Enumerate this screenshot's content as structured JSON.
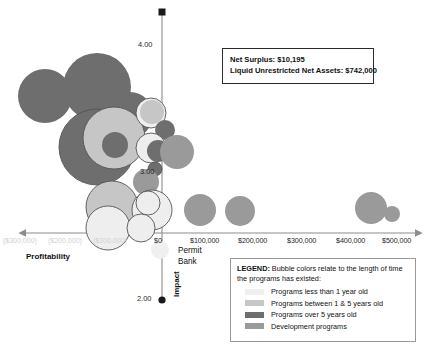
{
  "callout": {
    "line1": "Net Surplus: $10,195",
    "line2": "Liquid Unrestricted Net Assets: $742,000"
  },
  "annotations": {
    "permit_bank_line1": "Permit",
    "permit_bank_line2": "Bank"
  },
  "axes": {
    "x_title": "Profitability",
    "y_title": "Impact",
    "x_ticks": [
      "($300,000)",
      "($200,000)",
      "($100,000)",
      "$0",
      "$100,000",
      "$200,000",
      "$300,000",
      "$400,000",
      "$500,000"
    ],
    "y_ticks": [
      "4.00",
      "3.00",
      "2.00"
    ]
  },
  "legend": {
    "title": "LEGEND:",
    "description": " Bubble colors relate to the length of time the programs has existed:",
    "items": [
      {
        "label": "Programs less than 1 year old",
        "color": "#eeeeee"
      },
      {
        "label": "Programs between 1 & 5 years old",
        "color": "#c6c6c6"
      },
      {
        "label": "Programs over 5 years old",
        "color": "#6e6e6e"
      },
      {
        "label": "Development programs",
        "color": "#9a9a9a"
      }
    ]
  },
  "colors": {
    "axis_line": "#8c8c8c",
    "bubble_light": "#eeeeee",
    "bubble_midlight": "#c6c6c6",
    "bubble_dark": "#6e6e6e",
    "bubble_mid": "#9a9a9a",
    "bubble_stroke": "#555555",
    "neg_tick": "#d2d2d2"
  },
  "chart_data": {
    "type": "scatter",
    "title": "",
    "subtitle": "",
    "xlabel": "Profitability",
    "ylabel": "Impact",
    "xlim": [
      -350000,
      520000
    ],
    "ylim": [
      2.0,
      4.2
    ],
    "x_ticks": [
      -300000,
      -200000,
      -100000,
      0,
      100000,
      200000,
      300000,
      400000,
      500000
    ],
    "x_tick_labels": [
      "($300,000)",
      "($200,000)",
      "($100,000)",
      "$0",
      "$100,000",
      "$200,000",
      "$300,000",
      "$400,000",
      "$500,000"
    ],
    "y_ticks": [
      2.0,
      3.0,
      4.0
    ],
    "y_tick_labels": [
      "2.00",
      "3.00",
      "4.00"
    ],
    "grid": false,
    "legend_position": "bottom-right",
    "bubble_size_meaning": "budget size",
    "color_meaning": "program age",
    "series": [
      {
        "name": "Programs less than 1 year old",
        "color": "#eeeeee"
      },
      {
        "name": "Programs between 1 & 5 years old",
        "color": "#c6c6c6"
      },
      {
        "name": "Programs over 5 years old",
        "color": "#6e6e6e"
      },
      {
        "name": "Development programs",
        "color": "#9a9a9a"
      }
    ],
    "points": [
      {
        "cx": 45,
        "cy": 96,
        "r": 27,
        "color": "#6e6e6e",
        "stroke": false,
        "series": "Programs over 5 years old"
      },
      {
        "cx": 97,
        "cy": 87,
        "r": 34,
        "color": "#6e6e6e",
        "stroke": false,
        "series": "Programs over 5 years old"
      },
      {
        "cx": 130,
        "cy": 115,
        "r": 23,
        "color": "#6e6e6e",
        "stroke": false,
        "series": "Programs over 5 years old"
      },
      {
        "cx": 97,
        "cy": 147,
        "r": 38,
        "color": "#6e6e6e",
        "stroke": true,
        "series": "Programs over 5 years old"
      },
      {
        "cx": 114,
        "cy": 138,
        "r": 31,
        "color": "#c6c6c6",
        "stroke": true,
        "series": "Programs between 1 & 5 years old"
      },
      {
        "cx": 115,
        "cy": 145,
        "r": 13,
        "color": "#6e6e6e",
        "stroke": false,
        "series": "Programs over 5 years old"
      },
      {
        "cx": 151,
        "cy": 113,
        "r": 15,
        "color": "#eeeeee",
        "stroke": true,
        "series": "Programs less than 1 year old"
      },
      {
        "cx": 152,
        "cy": 112,
        "r": 12,
        "color": "#c6c6c6",
        "stroke": false,
        "series": "Programs between 1 & 5 years old"
      },
      {
        "cx": 165,
        "cy": 130,
        "r": 10,
        "color": "#6e6e6e",
        "stroke": false,
        "series": "Programs over 5 years old"
      },
      {
        "cx": 151,
        "cy": 148,
        "r": 15,
        "color": "#eeeeee",
        "stroke": true,
        "series": "Programs less than 1 year old"
      },
      {
        "cx": 158,
        "cy": 151,
        "r": 11,
        "color": "#6e6e6e",
        "stroke": false,
        "series": "Programs over 5 years old"
      },
      {
        "cx": 177,
        "cy": 152,
        "r": 17,
        "color": "#9a9a9a",
        "stroke": false,
        "series": "Development programs"
      },
      {
        "cx": 155,
        "cy": 169,
        "r": 7,
        "color": "#6e6e6e",
        "stroke": true,
        "series": "Programs over 5 years old"
      },
      {
        "cx": 146,
        "cy": 182,
        "r": 13,
        "color": "#9a9a9a",
        "stroke": false,
        "series": "Development programs"
      },
      {
        "cx": 112,
        "cy": 207,
        "r": 26,
        "color": "#c6c6c6",
        "stroke": true,
        "series": "Programs between 1 & 5 years old"
      },
      {
        "cx": 108,
        "cy": 228,
        "r": 22,
        "color": "#eeeeee",
        "stroke": true,
        "series": "Programs less than 1 year old"
      },
      {
        "cx": 152,
        "cy": 210,
        "r": 20,
        "color": "#eeeeee",
        "stroke": true,
        "series": "Programs less than 1 year old"
      },
      {
        "cx": 148,
        "cy": 203,
        "r": 12,
        "color": "#eeeeee",
        "stroke": true,
        "series": "Programs less than 1 year old"
      },
      {
        "cx": 141,
        "cy": 228,
        "r": 14,
        "color": "#eeeeee",
        "stroke": true,
        "series": "Programs less than 1 year old"
      },
      {
        "cx": 160,
        "cy": 250,
        "r": 9,
        "color": "#f0f0f0",
        "stroke": false,
        "series": "Programs less than 1 year old"
      },
      {
        "cx": 200,
        "cy": 210,
        "r": 16,
        "color": "#9a9a9a",
        "stroke": false,
        "series": "Development programs"
      },
      {
        "cx": 240,
        "cy": 211,
        "r": 15,
        "color": "#9a9a9a",
        "stroke": false,
        "series": "Development programs"
      },
      {
        "cx": 371,
        "cy": 208,
        "r": 16,
        "color": "#9a9a9a",
        "stroke": false,
        "series": "Development programs"
      },
      {
        "cx": 392,
        "cy": 214,
        "r": 8,
        "color": "#9a9a9a",
        "stroke": false,
        "series": "Development programs"
      }
    ]
  }
}
